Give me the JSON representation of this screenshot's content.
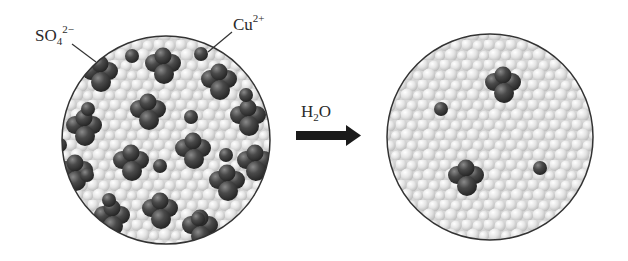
{
  "figure": {
    "left_panel": {
      "name": "solid CuSO4 lattice",
      "labels": {
        "sulfate": {
          "base": "SO",
          "sub": "4",
          "sup": "2−"
        },
        "copper": {
          "base": "Cu",
          "sup": "2+"
        }
      },
      "sulfate_count": 14,
      "copper_count": 12
    },
    "arrow": {
      "label": {
        "base": "H",
        "sub": "2",
        "tail": "O"
      }
    },
    "right_panel": {
      "name": "aqueous solution",
      "sulfate_count": 2,
      "copper_count": 2
    },
    "colors": {
      "ion_dark": "#3a3a3a",
      "ion_highlight": "#7a7a7a",
      "sulfur_light": "#c8c8c8",
      "water_light": "#e6e6e6",
      "water_mid": "#cfcfcf",
      "circle_outline": "#333333",
      "arrow": "#1a1a1a"
    }
  }
}
